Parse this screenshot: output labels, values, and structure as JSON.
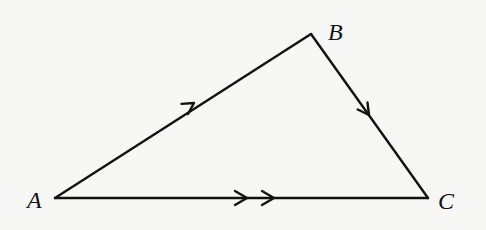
{
  "figure": {
    "type": "vector triangle diagram",
    "vertices": [
      {
        "id": "A",
        "label": "A",
        "x": 55,
        "y": 198
      },
      {
        "id": "B",
        "label": "B",
        "x": 311,
        "y": 34
      },
      {
        "id": "C",
        "label": "C",
        "x": 428,
        "y": 198
      }
    ],
    "edges": [
      {
        "from": "A",
        "to": "B",
        "arrow_count": 1
      },
      {
        "from": "B",
        "to": "C",
        "arrow_count": 1
      },
      {
        "from": "A",
        "to": "C",
        "arrow_count": 2
      }
    ],
    "colors": {
      "background": "#f7f7f5",
      "stroke": "#111111"
    }
  },
  "labels": {
    "a": "A",
    "b": "B",
    "c": "C"
  }
}
